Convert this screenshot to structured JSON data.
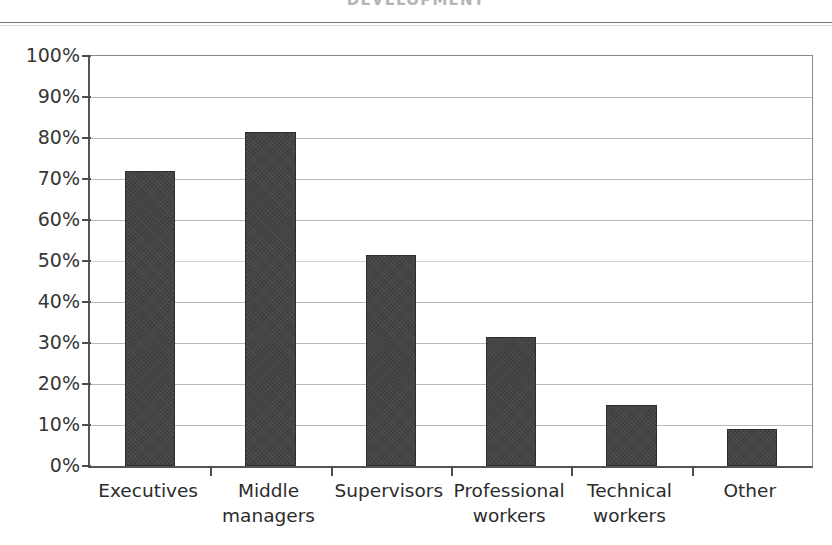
{
  "page": {
    "title": "DEVELOPMENT"
  },
  "chart_data": {
    "type": "bar",
    "title": "DEVELOPMENT",
    "xlabel": "",
    "ylabel": "",
    "ylim": [
      0,
      100
    ],
    "y_unit": "%",
    "grid": true,
    "legend": "none",
    "orientation": "vertical",
    "bar_color": "#3f3f3f",
    "categories": [
      "Executives",
      "Middle managers",
      "Supervisors",
      "Professional workers",
      "Technical workers",
      "Other"
    ],
    "category_labels_wrapped": [
      "Executives",
      "Middle\nmanagers",
      "Supervisors",
      "Professional\nworkers",
      "Technical\nworkers",
      "Other"
    ],
    "values": [
      72,
      81.5,
      51.5,
      31.5,
      15,
      9
    ],
    "y_ticks": [
      0,
      10,
      20,
      30,
      40,
      50,
      60,
      70,
      80,
      90,
      100
    ],
    "y_tick_labels": [
      "0%",
      "10%",
      "20%",
      "30%",
      "40%",
      "50%",
      "60%",
      "70%",
      "80%",
      "90%",
      "100%"
    ]
  }
}
